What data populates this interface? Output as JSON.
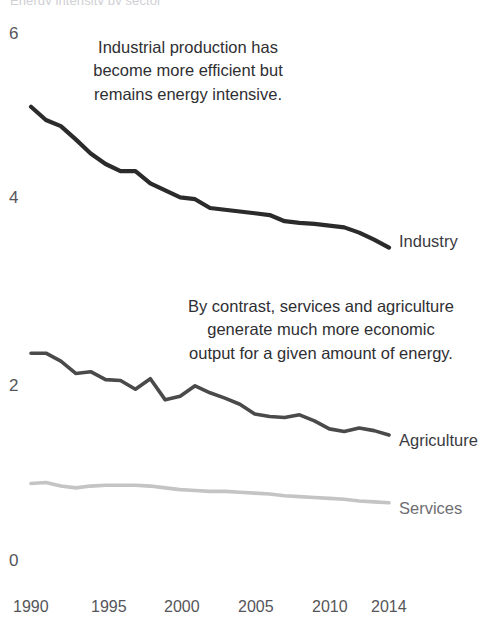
{
  "figure": {
    "clipped_header": "Energy intensity by sector",
    "background_color": "#ffffff"
  },
  "axes": {
    "y_ticks": [
      "6",
      "4",
      "2",
      "0"
    ],
    "x_ticks": [
      "1990",
      "1995",
      "2000",
      "2005",
      "2010",
      "2014"
    ]
  },
  "annotations": [
    {
      "name": "industry-annotation",
      "text": "Industrial production has\nbecome more efficient but\nremains energy intensive."
    },
    {
      "name": "services-agriculture-annotation",
      "text": "By contrast, services and agriculture\ngenerate much more economic\noutput for a given amount of energy."
    }
  ],
  "series_labels": {
    "industry": "Industry",
    "agriculture": "Agriculture",
    "services": "Services"
  },
  "colors": {
    "industry": "#2b2b2b",
    "agriculture": "#4a4a4a",
    "services": "#c4c4c4",
    "tick_text": "#55555a",
    "annotation_text": "#2f2f33"
  },
  "chart_data": {
    "type": "line",
    "title": "Energy intensity by sector",
    "xlabel": "",
    "ylabel": "",
    "xlim": [
      1990,
      2014
    ],
    "ylim": [
      0,
      6
    ],
    "yticks": [
      0,
      2,
      4,
      6
    ],
    "xticks": [
      1990,
      1995,
      2000,
      2005,
      2010,
      2014
    ],
    "grid": false,
    "legend": "inline-right-end-labels",
    "x": [
      1990,
      1991,
      1992,
      1993,
      1994,
      1995,
      1996,
      1997,
      1998,
      1999,
      2000,
      2001,
      2002,
      2003,
      2004,
      2005,
      2006,
      2007,
      2008,
      2009,
      2010,
      2011,
      2012,
      2013,
      2014
    ],
    "series": [
      {
        "name": "Industry",
        "color": "#2b2b2b",
        "values": [
          5.15,
          5.0,
          4.93,
          4.78,
          4.62,
          4.5,
          4.42,
          4.42,
          4.28,
          4.2,
          4.12,
          4.1,
          4.0,
          3.98,
          3.96,
          3.94,
          3.92,
          3.85,
          3.83,
          3.82,
          3.8,
          3.78,
          3.72,
          3.64,
          3.55
        ]
      },
      {
        "name": "Agriculture",
        "color": "#4a4a4a",
        "values": [
          2.35,
          2.35,
          2.26,
          2.12,
          2.14,
          2.05,
          2.04,
          1.94,
          2.06,
          1.82,
          1.86,
          1.98,
          1.9,
          1.84,
          1.77,
          1.66,
          1.63,
          1.62,
          1.65,
          1.58,
          1.49,
          1.46,
          1.5,
          1.47,
          1.42
        ]
      },
      {
        "name": "Services",
        "color": "#c4c4c4",
        "values": [
          0.87,
          0.88,
          0.84,
          0.82,
          0.84,
          0.85,
          0.85,
          0.85,
          0.84,
          0.82,
          0.8,
          0.79,
          0.78,
          0.78,
          0.77,
          0.76,
          0.75,
          0.73,
          0.72,
          0.71,
          0.7,
          0.69,
          0.67,
          0.66,
          0.65
        ]
      }
    ]
  }
}
